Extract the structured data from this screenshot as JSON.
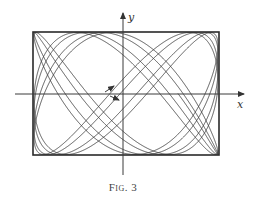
{
  "figure": {
    "caption": "Fig. 3",
    "axes": {
      "x_label": "x",
      "y_label": "y"
    },
    "curve": {
      "type": "lissajous",
      "description": "Quasi-periodic trajectory filling a rectangle (two independent oscillations along x and y)",
      "freq_ratio_x_to_y": "3:5 (approx., near-incommensurate)"
    },
    "direction_arrows": 2
  },
  "colors": {
    "ink": "#333333",
    "background": "#ffffff"
  }
}
